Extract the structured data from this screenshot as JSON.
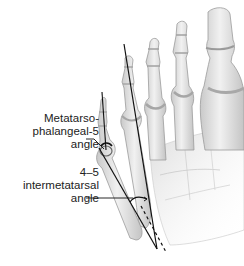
{
  "figure": {
    "labels": [
      {
        "id": "mtp5",
        "lines": [
          "Metatarso-",
          "phalangeal-5",
          "angle"
        ]
      },
      {
        "id": "im45",
        "lines": [
          "4–5",
          "intermetatarsal",
          "angle"
        ]
      }
    ],
    "colors": {
      "bone_fill": "#e4e4e4",
      "bone_shade": "#b9b9b9",
      "bone_outline": "#9a9a9a",
      "line": "#111111",
      "background": "#ffffff"
    }
  }
}
